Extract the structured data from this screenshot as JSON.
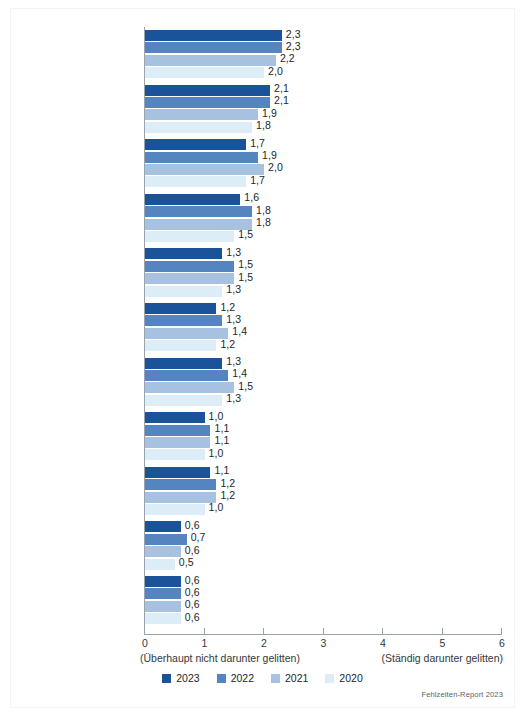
{
  "chart_data": {
    "type": "bar",
    "orientation": "horizontal",
    "title": "",
    "subtitle": "",
    "xlabel": "",
    "ylabel": "",
    "xlim": [
      0,
      6
    ],
    "xticks": [
      "0",
      "1",
      "2",
      "3",
      "4",
      "5",
      "6"
    ],
    "grid": false,
    "legend_position": "bottom-center",
    "axis_caption_left": "(Überhaupt nicht darunter gelitten)",
    "axis_caption_right": "(Ständig darunter gelitten)",
    "source_note": "Fehlzeiten-Report 2023",
    "categories": [
      "Erschöpfung",
      "Wut und Verärgerung",
      "Lustlosigkeit, wie\n„ausgebrannt sein\"",
      "Nervosität und\nReizbarkeit",
      "Niedergeschlagenheit",
      "Konzentrationsprobleme",
      "Schlafstörungen",
      "Zweifel an den\neigenen Fähigkeiten",
      "Kopfschmerzen",
      "Angstgefühle bei\nund vor der Arbeit",
      "Magen-Darm-\nBeschwerden"
    ],
    "series": [
      {
        "name": "2023",
        "color": "#1a5399",
        "values": [
          2.3,
          2.1,
          1.7,
          1.6,
          1.3,
          1.2,
          1.3,
          1.0,
          1.1,
          0.6,
          0.6
        ],
        "labels": [
          "2,3",
          "2,1",
          "1,7",
          "1,6",
          "1,3",
          "1,2",
          "1,3",
          "1,0",
          "1,1",
          "0,6",
          "0,6"
        ]
      },
      {
        "name": "2022",
        "color": "#5585c0",
        "values": [
          2.3,
          2.1,
          1.9,
          1.8,
          1.5,
          1.3,
          1.4,
          1.1,
          1.2,
          0.7,
          0.6
        ],
        "labels": [
          "2,3",
          "2,1",
          "1,9",
          "1,8",
          "1,5",
          "1,3",
          "1,4",
          "1,1",
          "1,2",
          "0,7",
          "0,6"
        ]
      },
      {
        "name": "2021",
        "color": "#a7c2e0",
        "values": [
          2.2,
          1.9,
          2.0,
          1.8,
          1.5,
          1.4,
          1.5,
          1.1,
          1.2,
          0.6,
          0.6
        ],
        "labels": [
          "2,2",
          "1,9",
          "2,0",
          "1,8",
          "1,5",
          "1,4",
          "1,5",
          "1,1",
          "1,2",
          "0,6",
          "0,6"
        ]
      },
      {
        "name": "2020",
        "color": "#ddedf8",
        "values": [
          2.0,
          1.8,
          1.7,
          1.5,
          1.3,
          1.2,
          1.3,
          1.0,
          1.0,
          0.5,
          0.6
        ],
        "labels": [
          "2,0",
          "1,8",
          "1,7",
          "1,5",
          "1,3",
          "1,2",
          "1,3",
          "1,0",
          "1,0",
          "0,5",
          "0,6"
        ]
      }
    ]
  },
  "legend": {
    "items": [
      {
        "label": "2023",
        "color": "#1a5399"
      },
      {
        "label": "2022",
        "color": "#5585c0"
      },
      {
        "label": "2021",
        "color": "#a7c2e0"
      },
      {
        "label": "2020",
        "color": "#ddedf8"
      }
    ]
  }
}
